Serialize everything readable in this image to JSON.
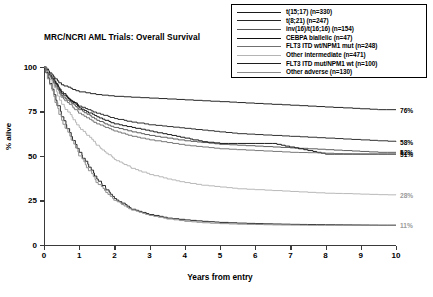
{
  "chart_data": {
    "type": "line",
    "title": "MRC/NCRI AML Trials: Overall Survival",
    "xlabel": "Years from entry",
    "ylabel": "% alive",
    "xlim": [
      0,
      10
    ],
    "ylim": [
      0,
      100
    ],
    "xticks": [
      "0",
      "1",
      "2",
      "3",
      "4",
      "5",
      "6",
      "7",
      "8",
      "9",
      "10"
    ],
    "yticks": [
      "0",
      "25",
      "50",
      "75",
      "100"
    ],
    "grid": false,
    "legend_position": "top-right",
    "x": [
      0,
      0.5,
      1,
      1.5,
      2,
      2.5,
      3,
      3.5,
      4,
      4.5,
      5,
      5.5,
      6,
      6.5,
      7,
      7.5,
      8,
      8.5,
      9,
      9.5,
      10
    ],
    "series": [
      {
        "name": "t(15;17) (n=330)",
        "label": "t(15;17)",
        "n": 330,
        "color": "#1a1a1a",
        "endpoint_label": "76%",
        "endpoint_value": 76,
        "values": [
          100,
          90,
          86,
          84.5,
          83.5,
          83,
          82.5,
          82,
          81.5,
          81,
          80.5,
          80,
          79.5,
          79,
          78.5,
          78,
          77.5,
          77,
          76.5,
          76,
          76
        ]
      },
      {
        "name": "t(8;21) (n=247)",
        "label": "t(8;21)",
        "n": 247,
        "color": "#262626",
        "endpoint_label": "58%",
        "endpoint_value": 58,
        "values": [
          100,
          85,
          78,
          74,
          71,
          69,
          67.5,
          66.5,
          65.5,
          64.5,
          63.5,
          62.5,
          62,
          61.5,
          61,
          60.5,
          60,
          59.5,
          59,
          58.5,
          58
        ]
      },
      {
        "name": "inv(16)/t(16;16) (n=154)",
        "label": "inv(16)/t(16;16)",
        "n": 154,
        "color": "#555555",
        "endpoint_label": "52%",
        "endpoint_value": 52,
        "values": [
          100,
          84,
          76,
          70,
          66,
          63.5,
          61.5,
          60,
          58.5,
          57.5,
          56.5,
          56,
          55.5,
          55,
          54.5,
          54,
          53.5,
          53,
          52.5,
          52,
          52
        ]
      },
      {
        "name": "CEBPA biallelic (n=47)",
        "label": "CEBPA biallelic",
        "n": 47,
        "color": "#111111",
        "endpoint_label": "51%",
        "endpoint_value": 51,
        "values": [
          100,
          86,
          77,
          72,
          68,
          66,
          64,
          62,
          60,
          58,
          57,
          57,
          57,
          57,
          55,
          53,
          51,
          51,
          51,
          51,
          51
        ]
      },
      {
        "name": "FLT3 ITD wt/NPM1 mut (n=248)",
        "label": "FLT3 ITD wt/NPM1 mut",
        "n": 248,
        "color": "#707070",
        "endpoint_label": "",
        "endpoint_value": 51,
        "values": [
          100,
          83,
          74,
          68,
          64,
          61,
          59,
          57.5,
          56,
          55,
          54,
          53.5,
          53,
          52.5,
          52,
          51.8,
          51.5,
          51.2,
          51,
          51,
          51
        ]
      },
      {
        "name": "Other intermediate (n=471)",
        "label": "Other intermediate",
        "n": 471,
        "color": "#b4b4b4",
        "endpoint_label": "28%",
        "endpoint_value": 28,
        "values": [
          100,
          79,
          66,
          56,
          48,
          43,
          39.5,
          37,
          35,
          33.5,
          32.5,
          31.5,
          31,
          30.5,
          30,
          29.5,
          29,
          28.8,
          28.5,
          28.2,
          28
        ]
      },
      {
        "name": "FLT3 ITD mut/NPM1 wt (n=100)",
        "label": "FLT3 ITD mut/NPM1 wt",
        "n": 100,
        "color": "#1f1f1f",
        "endpoint_label": "",
        "endpoint_value": 11,
        "values": [
          100,
          72,
          52,
          37,
          26,
          20,
          17,
          15,
          14,
          13.2,
          12.6,
          12.2,
          11.9,
          11.7,
          11.5,
          11.4,
          11.3,
          11.2,
          11.1,
          11,
          11
        ]
      },
      {
        "name": "Other adverse (n=130)",
        "label": "Other adverse",
        "n": 130,
        "color": "#8a8a8a",
        "endpoint_label": "11%",
        "endpoint_value": 11,
        "values": [
          100,
          70,
          50,
          35,
          25,
          19.5,
          16.5,
          14.5,
          13.2,
          12.4,
          11.9,
          11.6,
          11.4,
          11.2,
          11.1,
          11,
          11,
          11,
          11,
          11,
          11
        ]
      }
    ]
  }
}
